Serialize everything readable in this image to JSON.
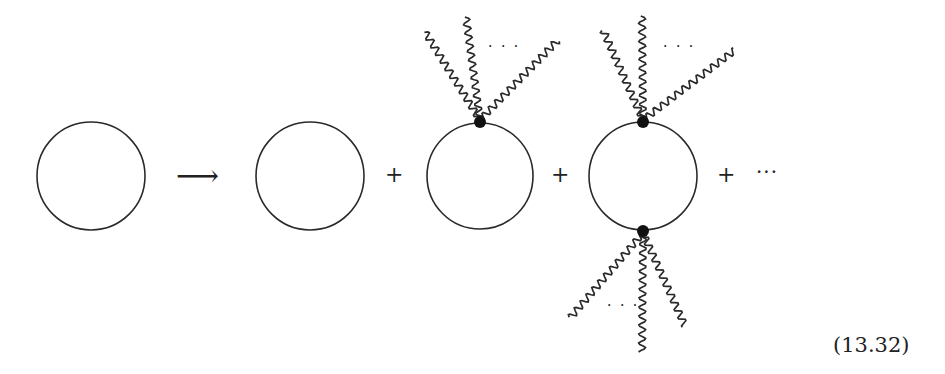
{
  "diagram": {
    "type": "feynman-diagram-expansion",
    "arrow": "⟶",
    "plus": "+",
    "ellipsis": "···",
    "photon_ellipsis": "· · ·",
    "equation_number": "(13.32)",
    "terms": [
      {
        "id": "bare-loop-lhs",
        "vertices": 0
      },
      {
        "id": "bare-loop",
        "vertices": 0
      },
      {
        "id": "one-vertex-loop",
        "vertices": 1,
        "photon_lines_per_vertex": 3
      },
      {
        "id": "two-vertex-loop",
        "vertices": 2,
        "photon_lines_per_vertex": 3
      }
    ],
    "colors": {
      "line": "#2a2a2a",
      "vertex": "#111111",
      "background": "#ffffff"
    }
  }
}
